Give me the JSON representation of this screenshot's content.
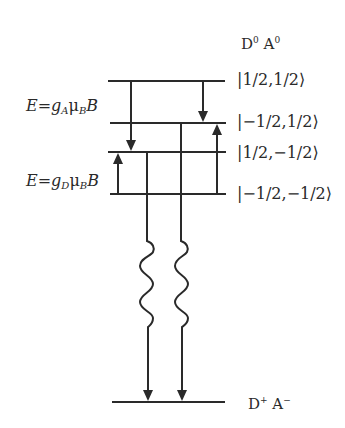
{
  "diagram": {
    "initial_state": {
      "donor": "D",
      "donor_charge": "0",
      "acceptor": "A",
      "acceptor_charge": "0"
    },
    "final_state": {
      "donor": "D",
      "donor_charge": "+",
      "acceptor": "A",
      "acceptor_charge": "−"
    },
    "levels": [
      {
        "ket": "|1/2,1/2⟩",
        "y": 81
      },
      {
        "ket": "|−1/2,1/2⟩",
        "y": 123
      },
      {
        "ket": "|1/2,−1/2⟩",
        "y": 152
      },
      {
        "ket": "|−1/2,−1/2⟩",
        "y": 194
      }
    ],
    "ground_level_y": 402,
    "splitting_labels": {
      "acceptor": {
        "E": "E",
        "eq": "=",
        "g": "g",
        "g_sub": "A",
        "mu": "μ",
        "mu_sub": "B",
        "B": "B"
      },
      "donor": {
        "E": "E",
        "eq": "=",
        "g": "g",
        "g_sub": "D",
        "mu": "μ",
        "mu_sub": "B",
        "B": "B"
      }
    },
    "line_color": "#2a2a2a"
  }
}
